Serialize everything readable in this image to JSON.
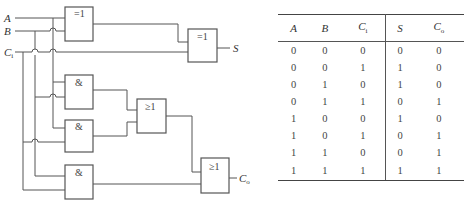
{
  "circuit": {
    "title": "Full adder logic diagram",
    "inputs": [
      {
        "name": "A",
        "label": "A",
        "sub": ""
      },
      {
        "name": "B",
        "label": "B",
        "sub": ""
      },
      {
        "name": "Ci",
        "label": "C",
        "sub": "i"
      }
    ],
    "outputs": [
      {
        "name": "S",
        "label": "S",
        "sub": ""
      },
      {
        "name": "Co",
        "label": "C",
        "sub": "o"
      }
    ],
    "gates": [
      {
        "id": "xor1",
        "type": "XOR",
        "symbol": "=1"
      },
      {
        "id": "xor2",
        "type": "XOR",
        "symbol": "=1"
      },
      {
        "id": "and1",
        "type": "AND",
        "symbol": "&"
      },
      {
        "id": "and2",
        "type": "AND",
        "symbol": "&"
      },
      {
        "id": "or1",
        "type": "OR",
        "symbol": "≥1"
      },
      {
        "id": "and3",
        "type": "AND",
        "symbol": "&"
      },
      {
        "id": "or2",
        "type": "OR",
        "symbol": "≥1"
      }
    ],
    "colors": {
      "line": "#555555",
      "text": "#333333"
    }
  },
  "truth_table": {
    "headers": [
      {
        "label": "A",
        "sub": ""
      },
      {
        "label": "B",
        "sub": ""
      },
      {
        "label": "C",
        "sub": "i"
      },
      {
        "label": "S",
        "sub": ""
      },
      {
        "label": "C",
        "sub": "o"
      }
    ],
    "rows": [
      [
        "0",
        "0",
        "0",
        "0",
        "0"
      ],
      [
        "0",
        "0",
        "1",
        "1",
        "0"
      ],
      [
        "0",
        "1",
        "0",
        "1",
        "0"
      ],
      [
        "0",
        "1",
        "1",
        "0",
        "1"
      ],
      [
        "1",
        "0",
        "0",
        "1",
        "0"
      ],
      [
        "1",
        "0",
        "1",
        "0",
        "1"
      ],
      [
        "1",
        "1",
        "0",
        "0",
        "1"
      ],
      [
        "1",
        "1",
        "1",
        "1",
        "1"
      ]
    ]
  }
}
